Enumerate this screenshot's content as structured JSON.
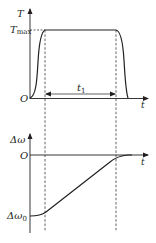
{
  "diagram": {
    "top_plot": {
      "y_axis_label": "T",
      "y_level_label_main": "T",
      "y_level_label_sub": "max",
      "origin_label": "O",
      "x_axis_label": "t",
      "interval_label_main": "t",
      "interval_label_sub": "1"
    },
    "bottom_plot": {
      "y_axis_label": "Δω",
      "origin_label": "O",
      "x_axis_label": "t",
      "y_level_label_main": "Δω",
      "y_level_label_sub": "0"
    },
    "colors": {
      "line": "#231f20",
      "background": "#ffffff"
    }
  }
}
